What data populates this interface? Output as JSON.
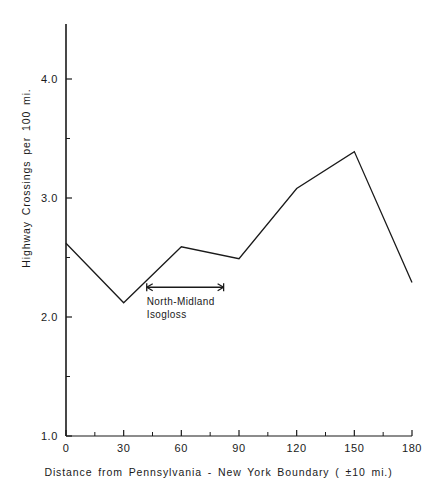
{
  "chart_data": {
    "type": "line",
    "title": "",
    "xlabel": "Distance  from  Pennsylvania - New York  Boundary  ( ±10 mi.)",
    "ylabel": "Highway  Crossings  per  100 mi.",
    "x": [
      0,
      30,
      60,
      90,
      120,
      150,
      180
    ],
    "values": [
      2.62,
      2.12,
      2.59,
      2.49,
      3.08,
      3.39,
      2.29
    ],
    "series": [
      {
        "name": "Highway crossings per 100 mi.",
        "x": [
          0,
          30,
          60,
          90,
          120,
          150,
          180
        ],
        "values": [
          2.62,
          2.12,
          2.59,
          2.49,
          3.08,
          3.39,
          2.29
        ]
      }
    ],
    "xlim": [
      0,
      180
    ],
    "ylim": [
      1.0,
      4.4
    ],
    "xticks": [
      0,
      30,
      60,
      90,
      120,
      150,
      180
    ],
    "xtick_labels": [
      "0",
      "30",
      "60",
      "90",
      "120",
      "150",
      "180"
    ],
    "x_minor_ticks": [
      15,
      45,
      75,
      105,
      135,
      165
    ],
    "yticks": [
      1.0,
      2.0,
      3.0,
      4.0
    ],
    "ytick_labels": [
      "1.0",
      "2.0",
      "3.0",
      "4.0"
    ],
    "y_minor_ticks": [
      1.5,
      2.5,
      3.5
    ],
    "grid": false,
    "legend": false,
    "line_color": "#1a1a1a",
    "annotations": [
      {
        "name": "north-midland-isogloss",
        "text_line1": "North-Midland",
        "text_line2": "Isogloss",
        "arrow_x_start": 42,
        "arrow_x_end": 82,
        "arrow_y": 2.25,
        "double_headed": true
      }
    ]
  },
  "axes": {
    "y_title": "Highway  Crossings  per  100 mi.",
    "x_title": "Distance  from  Pennsylvania - New York  Boundary  ( ±10 mi.)"
  },
  "annotation": {
    "line1": "North-Midland",
    "line2": "Isogloss"
  }
}
